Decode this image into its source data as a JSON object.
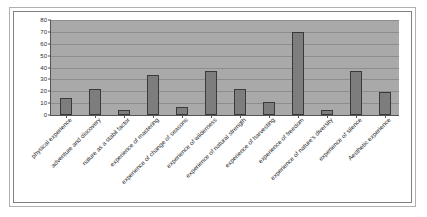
{
  "chart_data": {
    "type": "bar",
    "title": "",
    "xlabel": "",
    "ylabel": "",
    "ylim": [
      0,
      80
    ],
    "yticks": [
      0,
      10,
      20,
      30,
      40,
      50,
      60,
      70,
      80
    ],
    "grid": true,
    "legend": "none",
    "categories": [
      "physical experience",
      "adventure and discovery",
      "nature as a stabil factor",
      "experience of mastering",
      "experience of change of seasons",
      "experience of wilderness",
      "experience of natural strength",
      "experience of harvesting",
      "experience of freedom",
      "experience of nature's diversity",
      "experience of silence",
      "Aesthetic experience"
    ],
    "values": [
      14,
      22,
      4,
      34,
      7,
      37,
      22,
      11,
      70,
      4,
      37,
      19
    ],
    "bar_color": "#7d7d7d",
    "bar_edge_color": "#3a3a3a",
    "plot_background": "#a9a9a9",
    "gridline_color": "#8d8d8d",
    "axis_color": "#555555",
    "text_color": "#2d2d2d"
  }
}
